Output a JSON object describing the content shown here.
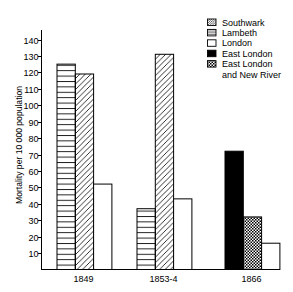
{
  "chart_data": {
    "type": "bar",
    "title": "",
    "xlabel": "",
    "ylabel": "Mortality per 10 000 population",
    "ylim": [
      0,
      140
    ],
    "yticks": [
      10,
      20,
      30,
      40,
      50,
      60,
      70,
      80,
      90,
      100,
      110,
      120,
      130,
      140
    ],
    "grid": false,
    "categories": [
      "1849",
      "1853-4",
      "1866"
    ],
    "series": [
      {
        "name": "Southwark",
        "pattern": "diagonal-hatch",
        "values": [
          119,
          131,
          null
        ]
      },
      {
        "name": "Lambeth",
        "pattern": "horizontal-lines",
        "values": [
          125,
          37,
          null
        ]
      },
      {
        "name": "London",
        "pattern": "white",
        "values": [
          52,
          43,
          16
        ]
      },
      {
        "name": "East London",
        "pattern": "solid-black",
        "values": [
          null,
          null,
          72
        ]
      },
      {
        "name": "East London and New River",
        "pattern": "checkered",
        "values": [
          null,
          null,
          32
        ]
      }
    ],
    "bar_order": [
      [
        "Lambeth",
        "Southwark",
        "London"
      ],
      [
        "Lambeth",
        "Southwark",
        "London"
      ],
      [
        "East London",
        "East London and New River",
        "London"
      ]
    ],
    "legend": {
      "position": "top-right",
      "entries": [
        {
          "series": "Southwark",
          "pattern": "diagonal-hatch",
          "lines": [
            "Southwark"
          ]
        },
        {
          "series": "Lambeth",
          "pattern": "horizontal-lines",
          "lines": [
            "Lambeth"
          ]
        },
        {
          "series": "London",
          "pattern": "white",
          "lines": [
            "London"
          ]
        },
        {
          "series": "East London",
          "pattern": "solid-black",
          "lines": [
            "East London"
          ]
        },
        {
          "series": "East London and New River",
          "pattern": "checkered",
          "lines": [
            "East London",
            "and New River"
          ]
        }
      ]
    }
  },
  "colors": {
    "ink": "#000000",
    "paper": "#ffffff"
  }
}
